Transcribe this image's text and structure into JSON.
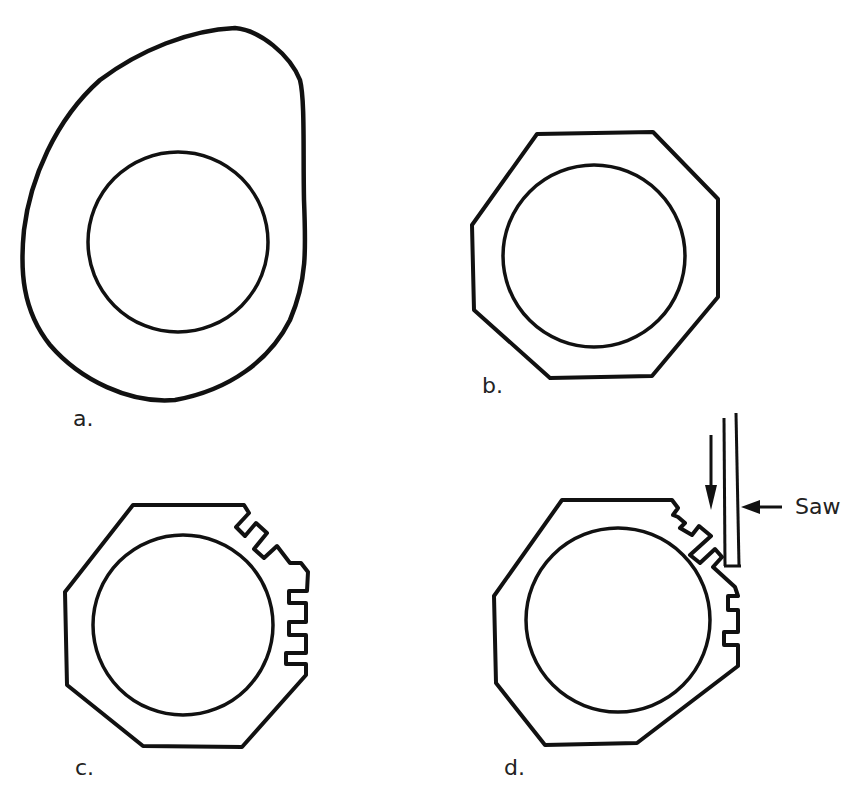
{
  "figure": {
    "panels": [
      {
        "id": "a",
        "label": "a.",
        "description": "Irregular rough blank with circular bore"
      },
      {
        "id": "b",
        "label": "b.",
        "description": "Blank trimmed to octagon with circular bore"
      },
      {
        "id": "c",
        "label": "c.",
        "description": "Octagonal blank with notches cut along two edges"
      },
      {
        "id": "d",
        "label": "d.",
        "description": "Octagonal blank with notches being cut by a saw"
      }
    ],
    "annotations": {
      "saw_label": "Saw"
    },
    "colors": {
      "line": "#111111",
      "background": "#ffffff",
      "text": "#222222"
    }
  }
}
